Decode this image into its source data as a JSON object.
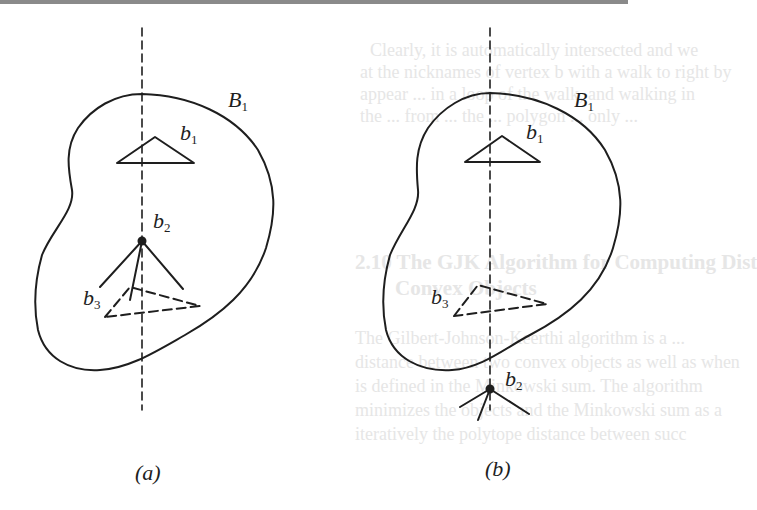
{
  "figure": {
    "panels": [
      {
        "id": "a",
        "caption": "(a)",
        "region_label": {
          "base": "B",
          "sub": "1"
        },
        "labels": {
          "b1": {
            "base": "b",
            "sub": "1"
          },
          "b2": {
            "base": "b",
            "sub": "2"
          },
          "b3": {
            "base": "b",
            "sub": "3"
          }
        },
        "vertex_b2_position": "inside region, on dashed line"
      },
      {
        "id": "b",
        "caption": "(b)",
        "region_label": {
          "base": "B",
          "sub": "1"
        },
        "labels": {
          "b1": {
            "base": "b",
            "sub": "1"
          },
          "b2": {
            "base": "b",
            "sub": "2"
          },
          "b3": {
            "base": "b",
            "sub": "3"
          }
        },
        "vertex_b2_position": "outside region, below, on dashed line"
      }
    ],
    "colors": {
      "stroke": "#1e1e1e",
      "rule": "#8a8a8a",
      "ghost_text": "#e6e6e6"
    }
  },
  "ghost_text": {
    "line1": "Clearly, it is automatically intersected and we",
    "line2": "at the nicknames of vertex b with a walk to right by",
    "line3": "appear ... in a loop of the walk, and walking in",
    "line4": "the ... from ... the ... polygon ... only ...",
    "heading": "2.10  The GJK Algorithm for Computing Dist",
    "heading2": "Convex Objects",
    "body1": "The Gilbert-Johnson-Keerthi algorithm is a ...",
    "body2": "distance between two convex objects as well as when",
    "body3": "is defined in the Minkowski sum. The algorithm",
    "body4": "minimizes the objects and the Minkowski sum as a",
    "body5": "iteratively the polytope distance between succ"
  }
}
